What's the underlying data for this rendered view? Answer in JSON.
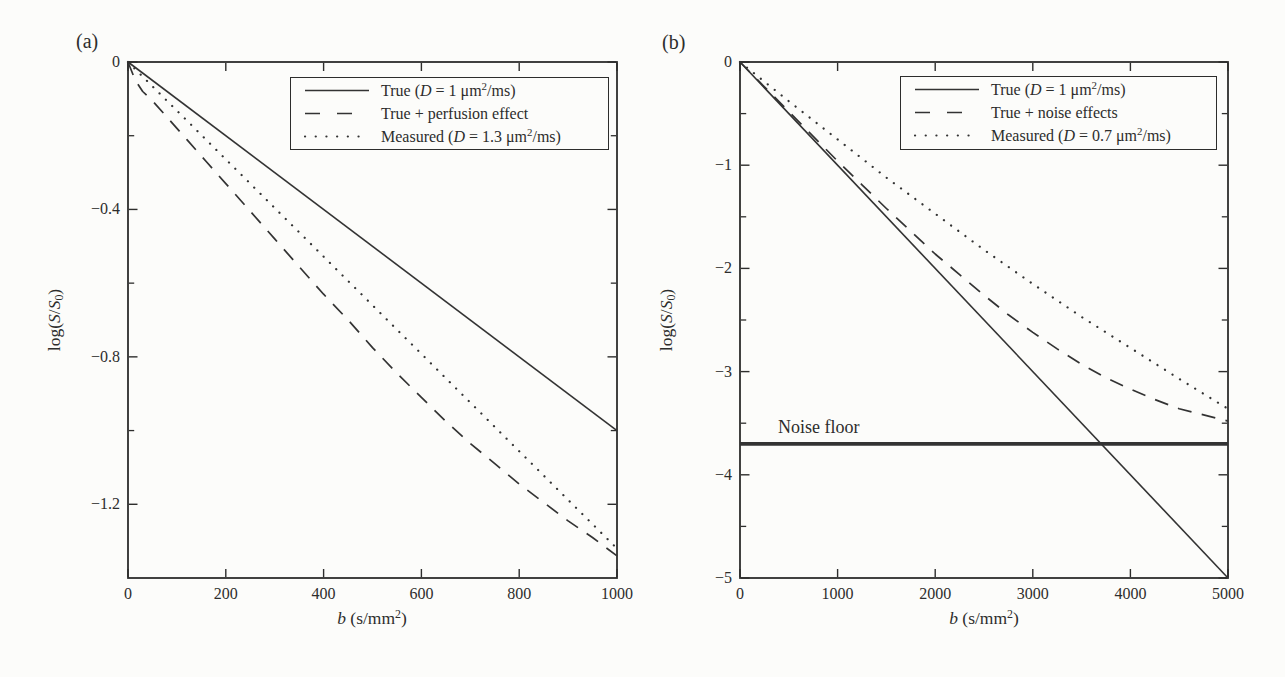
{
  "figure": {
    "ink_color": "#2d2d2c",
    "line_color": "#333333",
    "background": "#fcfcfa"
  },
  "chart_data": [
    {
      "id": "a",
      "panel_label": "(a)",
      "type": "line",
      "title": "",
      "xlabel": "b (s/mm²)",
      "xlabel_parts": [
        {
          "t": "b",
          "i": 1
        },
        {
          "t": " (s/mm"
        },
        {
          "t": "2",
          "sup": 1
        },
        {
          "t": ")"
        }
      ],
      "ylabel": "log(S/S₀)",
      "ylabel_parts": [
        {
          "t": "log("
        },
        {
          "t": "S",
          "i": 1
        },
        {
          "t": "/"
        },
        {
          "t": "S",
          "i": 1
        },
        {
          "t": "0",
          "sub": 1
        },
        {
          "t": ")"
        }
      ],
      "xlim": [
        0,
        1000
      ],
      "ylim": [
        -1.4,
        0
      ],
      "grid": false,
      "xticks": [
        {
          "v": 0,
          "label": "0"
        },
        {
          "v": 200,
          "label": "200"
        },
        {
          "v": 400,
          "label": "400"
        },
        {
          "v": 600,
          "label": "600"
        },
        {
          "v": 800,
          "label": "800"
        },
        {
          "v": 1000,
          "label": "1000"
        }
      ],
      "yticks": [
        {
          "v": 0,
          "label": "0"
        },
        {
          "v": -0.4,
          "label": "−0.4"
        },
        {
          "v": -0.8,
          "label": "−0.8"
        },
        {
          "v": -1.2,
          "label": "−1.2"
        }
      ],
      "yticks_minor": [
        -0.2,
        -0.6,
        -1.0
      ],
      "legend": {
        "position": "top-right-inside",
        "entries": [
          {
            "slug": "true-d1",
            "line": "solid",
            "label": "True (D = 1 μm²/ms)",
            "label_parts": [
              {
                "t": "True ("
              },
              {
                "t": "D",
                "i": 1
              },
              {
                "t": " = 1 μm"
              },
              {
                "t": "2",
                "sup": 1
              },
              {
                "t": "/ms)"
              }
            ]
          },
          {
            "slug": "true-plus-perfusion",
            "line": "dashed",
            "label": "True + perfusion effect",
            "label_parts": [
              {
                "t": "True + perfusion effect"
              }
            ]
          },
          {
            "slug": "measured-d1-3",
            "line": "dotted",
            "label": "Measured (D = 1.3 μm²/ms)",
            "label_parts": [
              {
                "t": "Measured ("
              },
              {
                "t": "D",
                "i": 1
              },
              {
                "t": " = 1.3 μm"
              },
              {
                "t": "2",
                "sup": 1
              },
              {
                "t": "/ms)"
              }
            ]
          }
        ]
      },
      "series": [
        {
          "slug": "true-d1",
          "name": "True (D = 1 μm²/ms)",
          "line": "solid",
          "points": [
            [
              0,
              0
            ],
            [
              1000,
              -1.0
            ]
          ]
        },
        {
          "slug": "true-plus-perfusion",
          "name": "True + perfusion effect",
          "line": "dashed",
          "points": [
            [
              0,
              0
            ],
            [
              15,
              -0.05
            ],
            [
              30,
              -0.08
            ],
            [
              50,
              -0.105
            ],
            [
              80,
              -0.15
            ],
            [
              120,
              -0.21
            ],
            [
              160,
              -0.27
            ],
            [
              200,
              -0.33
            ],
            [
              250,
              -0.405
            ],
            [
              300,
              -0.48
            ],
            [
              350,
              -0.555
            ],
            [
              400,
              -0.63
            ],
            [
              450,
              -0.7
            ],
            [
              500,
              -0.775
            ],
            [
              550,
              -0.845
            ],
            [
              600,
              -0.91
            ],
            [
              650,
              -0.975
            ],
            [
              700,
              -1.035
            ],
            [
              750,
              -1.09
            ],
            [
              800,
              -1.145
            ],
            [
              850,
              -1.195
            ],
            [
              900,
              -1.245
            ],
            [
              950,
              -1.29
            ],
            [
              1000,
              -1.34
            ]
          ]
        },
        {
          "slug": "measured-d1-3",
          "name": "Measured (D = 1.3 μm²/ms)",
          "line": "dotted",
          "points": [
            [
              0,
              0
            ],
            [
              1000,
              -1.32
            ]
          ]
        }
      ],
      "annotations": []
    },
    {
      "id": "b",
      "panel_label": "(b)",
      "type": "line",
      "title": "",
      "xlabel": "b (s/mm²)",
      "xlabel_parts": [
        {
          "t": "b",
          "i": 1
        },
        {
          "t": " (s/mm"
        },
        {
          "t": "2",
          "sup": 1
        },
        {
          "t": ")"
        }
      ],
      "ylabel": "log(S/S₀)",
      "ylabel_parts": [
        {
          "t": "log("
        },
        {
          "t": "S",
          "i": 1
        },
        {
          "t": "/"
        },
        {
          "t": "S",
          "i": 1
        },
        {
          "t": "0",
          "sub": 1
        },
        {
          "t": ")"
        }
      ],
      "xlim": [
        0,
        5000
      ],
      "ylim": [
        -5,
        0
      ],
      "grid": false,
      "xticks": [
        {
          "v": 0,
          "label": "0"
        },
        {
          "v": 1000,
          "label": "1000"
        },
        {
          "v": 2000,
          "label": "2000"
        },
        {
          "v": 3000,
          "label": "3000"
        },
        {
          "v": 4000,
          "label": "4000"
        },
        {
          "v": 5000,
          "label": "5000"
        }
      ],
      "yticks": [
        {
          "v": 0,
          "label": "0"
        },
        {
          "v": -1,
          "label": "−1"
        },
        {
          "v": -2,
          "label": "−2"
        },
        {
          "v": -3,
          "label": "−3"
        },
        {
          "v": -4,
          "label": "−4"
        },
        {
          "v": -5,
          "label": "−5"
        }
      ],
      "yticks_minor": [
        -0.5,
        -1.5,
        -2.5,
        -3.5,
        -4.5
      ],
      "legend": {
        "position": "top-right-inside",
        "entries": [
          {
            "slug": "true-d1",
            "line": "solid",
            "label": "True (D = 1 μm²/ms)",
            "label_parts": [
              {
                "t": "True ("
              },
              {
                "t": "D",
                "i": 1
              },
              {
                "t": " = 1 μm"
              },
              {
                "t": "2",
                "sup": 1
              },
              {
                "t": "/ms)"
              }
            ]
          },
          {
            "slug": "true-plus-noise",
            "line": "dashed",
            "label": "True + noise effects",
            "label_parts": [
              {
                "t": "True + noise effects"
              }
            ]
          },
          {
            "slug": "measured-d0-7",
            "line": "dotted",
            "label": "Measured (D = 0.7 μm²/ms)",
            "label_parts": [
              {
                "t": "Measured ("
              },
              {
                "t": "D",
                "i": 1
              },
              {
                "t": " = 0.7 μm"
              },
              {
                "t": "2",
                "sup": 1
              },
              {
                "t": "/ms)"
              }
            ]
          }
        ]
      },
      "series": [
        {
          "slug": "true-d1",
          "name": "True (D = 1 μm²/ms)",
          "line": "solid",
          "points": [
            [
              0,
              0
            ],
            [
              5000,
              -5.0
            ]
          ]
        },
        {
          "slug": "true-plus-noise",
          "name": "True + noise effects",
          "line": "dashed",
          "points": [
            [
              0,
              0
            ],
            [
              250,
              -0.24
            ],
            [
              500,
              -0.48
            ],
            [
              750,
              -0.72
            ],
            [
              1000,
              -0.96
            ],
            [
              1250,
              -1.19
            ],
            [
              1500,
              -1.42
            ],
            [
              1750,
              -1.64
            ],
            [
              2000,
              -1.86
            ],
            [
              2250,
              -2.06
            ],
            [
              2500,
              -2.26
            ],
            [
              2750,
              -2.45
            ],
            [
              3000,
              -2.62
            ],
            [
              3250,
              -2.78
            ],
            [
              3500,
              -2.93
            ],
            [
              3750,
              -3.06
            ],
            [
              4000,
              -3.17
            ],
            [
              4250,
              -3.27
            ],
            [
              4500,
              -3.36
            ],
            [
              4750,
              -3.42
            ],
            [
              5000,
              -3.48
            ]
          ]
        },
        {
          "slug": "measured-d0-7",
          "name": "Measured (D = 0.7 μm²/ms)",
          "line": "dotted",
          "points": [
            [
              0,
              0
            ],
            [
              500,
              -0.38
            ],
            [
              1000,
              -0.75
            ],
            [
              1500,
              -1.12
            ],
            [
              2000,
              -1.47
            ],
            [
              2500,
              -1.82
            ],
            [
              3000,
              -2.15
            ],
            [
              3500,
              -2.47
            ],
            [
              4000,
              -2.77
            ],
            [
              4500,
              -3.07
            ],
            [
              5000,
              -3.36
            ]
          ]
        },
        {
          "slug": "noise-floor",
          "name": "Noise floor",
          "line": "thick",
          "points": [
            [
              0,
              -3.7
            ],
            [
              5000,
              -3.7
            ]
          ]
        }
      ],
      "annotations": [
        {
          "slug": "noise-floor-label",
          "text": "Noise floor",
          "x": 390,
          "y": -3.44
        }
      ]
    }
  ]
}
